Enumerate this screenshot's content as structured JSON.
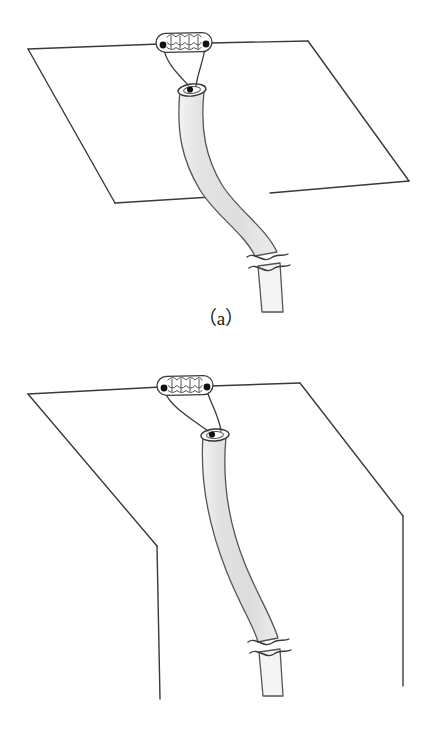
{
  "document": {
    "title": "Surgical anastomosis schematic",
    "background_color": "#ffffff"
  },
  "style": {
    "ink_color": "#3a3a3a",
    "ink_color_dark": "#1a1a1a",
    "tube_fill": "#e4e4e4",
    "tube_fill_light": "#f0f0f0",
    "tube_stroke": "#555555",
    "node_fill": "#ffffff",
    "dot_fill": "#111111",
    "line_width": 1.4
  },
  "figures": [
    {
      "id": "a",
      "caption": "（a）",
      "description": "Tissue plane drawn as a flat parallelogram with an oval anastomosis ring containing a wavy suture line on its upper edge; a shaded tubular conduit descends through the plane and is interrupted by a break symbol.",
      "parts": {
        "plane": "flat-parallelogram-sheet",
        "ring": "oval-anastomosis-ring",
        "ring_pattern": "wavy-suture-scallops",
        "ring_dots": 2,
        "stay_sutures": 2,
        "stoma": "small-ellipse-stoma",
        "stoma_dot": 1,
        "conduit": "shaded-curved-tube",
        "break_symbol": "double-wavy-break"
      }
    },
    {
      "id": "b",
      "caption": "（b）",
      "description": "The same anastomosis viewed with the tissue plane folded down into two angled flaps, the conduit running vertically between them and interrupted by a break symbol.",
      "parts": {
        "plane": "folded-flap-left",
        "plane_right": "folded-flap-right",
        "ring": "oval-anastomosis-ring",
        "ring_pattern": "wavy-suture-scallops",
        "ring_dots": 2,
        "stay_sutures": 2,
        "stoma": "small-ellipse-stoma",
        "stoma_dot": 1,
        "conduit": "shaded-curved-tube",
        "break_symbol": "double-wavy-break"
      }
    }
  ]
}
